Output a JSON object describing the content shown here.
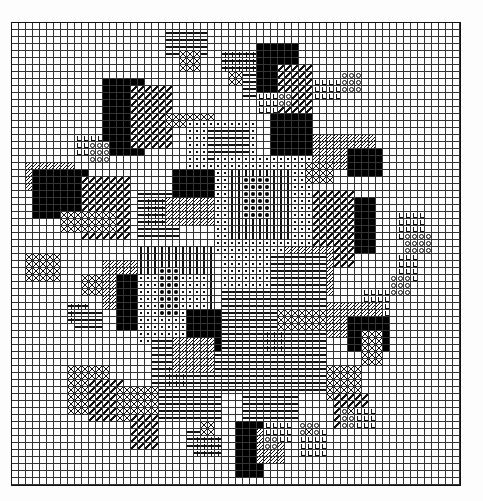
{
  "title": "Cross-stitch floral pattern chart",
  "grid": {
    "cols": 64,
    "rows": 66,
    "cell_px": 7,
    "line_color": "#333333",
    "border_color": "#111111"
  },
  "legend_symbols": {
    ".": "empty",
    "X": "cross stitch",
    "#": "dark filled cross",
    "/": "half diagonal stitch",
    "H": "hatched fill",
    "-": "dash",
    "|": "vertical bar",
    "o": "dot in square",
    "*": "filled dot",
    "+": "plus",
    "L": "L-shape",
    "O": "circle"
  },
  "regions": [
    {
      "sym": "-",
      "c0": 22,
      "c1": 27,
      "r0": 1,
      "r1": 4
    },
    {
      "sym": "X",
      "c0": 24,
      "c1": 26,
      "r0": 4,
      "r1": 6
    },
    {
      "sym": "+",
      "c0": 30,
      "c1": 34,
      "r0": 4,
      "r1": 6
    },
    {
      "sym": "-",
      "c0": 33,
      "c1": 35,
      "r0": 7,
      "r1": 10
    },
    {
      "sym": "X",
      "c0": 31,
      "c1": 32,
      "r0": 7,
      "r1": 8
    },
    {
      "sym": "#",
      "c0": 35,
      "c1": 40,
      "r0": 3,
      "r1": 10
    },
    {
      "sym": "/",
      "c0": 38,
      "c1": 42,
      "r0": 6,
      "r1": 14
    },
    {
      "sym": "#",
      "c0": 13,
      "c1": 18,
      "r0": 8,
      "r1": 18
    },
    {
      "sym": "/",
      "c0": 17,
      "c1": 22,
      "r0": 9,
      "r1": 17
    },
    {
      "sym": "X",
      "c0": 22,
      "c1": 28,
      "r0": 13,
      "r1": 14
    },
    {
      "sym": "o",
      "c0": 25,
      "c1": 34,
      "r0": 14,
      "r1": 20
    },
    {
      "sym": "-",
      "c0": 28,
      "c1": 33,
      "r0": 15,
      "r1": 19
    },
    {
      "sym": "#",
      "c0": 37,
      "c1": 42,
      "r0": 13,
      "r1": 18
    },
    {
      "sym": "H",
      "c0": 43,
      "c1": 51,
      "r0": 16,
      "r1": 20
    },
    {
      "sym": "#",
      "c0": 48,
      "c1": 52,
      "r0": 18,
      "r1": 21
    },
    {
      "sym": "L",
      "c0": 35,
      "c1": 37,
      "r0": 10,
      "r1": 12
    },
    {
      "sym": "O",
      "c0": 38,
      "c1": 39,
      "r0": 10,
      "r1": 11
    },
    {
      "sym": "L",
      "c0": 43,
      "c1": 46,
      "r0": 8,
      "r1": 10
    },
    {
      "sym": "O",
      "c0": 47,
      "c1": 49,
      "r0": 7,
      "r1": 9
    },
    {
      "sym": "L",
      "c0": 9,
      "c1": 12,
      "r0": 16,
      "r1": 18
    },
    {
      "sym": "O",
      "c0": 11,
      "c1": 13,
      "r0": 17,
      "r1": 19
    },
    {
      "sym": "H",
      "c0": 2,
      "c1": 8,
      "r0": 20,
      "r1": 23
    },
    {
      "sym": "#",
      "c0": 3,
      "c1": 10,
      "r0": 21,
      "r1": 27
    },
    {
      "sym": "/",
      "c0": 10,
      "c1": 16,
      "r0": 22,
      "r1": 30
    },
    {
      "sym": "X",
      "c0": 7,
      "c1": 14,
      "r0": 27,
      "r1": 29
    },
    {
      "sym": "-",
      "c0": 18,
      "c1": 23,
      "r0": 24,
      "r1": 30
    },
    {
      "sym": "+",
      "c0": 19,
      "c1": 21,
      "r0": 25,
      "r1": 28
    },
    {
      "sym": "#",
      "c0": 23,
      "c1": 28,
      "r0": 21,
      "r1": 25
    },
    {
      "sym": "H",
      "c0": 22,
      "c1": 28,
      "r0": 25,
      "r1": 28
    },
    {
      "sym": "o",
      "c0": 29,
      "c1": 42,
      "r0": 19,
      "r1": 32
    },
    {
      "sym": "|",
      "c0": 31,
      "c1": 39,
      "r0": 21,
      "r1": 30
    },
    {
      "sym": "*",
      "c0": 33,
      "c1": 36,
      "r0": 22,
      "r1": 27
    },
    {
      "sym": "#",
      "c0": 45,
      "c1": 51,
      "r0": 25,
      "r1": 32
    },
    {
      "sym": "/",
      "c0": 43,
      "c1": 48,
      "r0": 24,
      "r1": 34
    },
    {
      "sym": "X",
      "c0": 42,
      "c1": 45,
      "r0": 20,
      "r1": 22
    },
    {
      "sym": "L",
      "c0": 55,
      "c1": 58,
      "r0": 27,
      "r1": 30
    },
    {
      "sym": "O",
      "c0": 56,
      "c1": 59,
      "r0": 30,
      "r1": 32
    },
    {
      "sym": "L",
      "c0": 55,
      "c1": 57,
      "r0": 33,
      "r1": 36
    },
    {
      "sym": "O",
      "c0": 54,
      "c1": 56,
      "r0": 36,
      "r1": 38
    },
    {
      "sym": "L",
      "c0": 50,
      "c1": 53,
      "r0": 38,
      "r1": 41
    },
    {
      "sym": "H",
      "c0": 45,
      "c1": 52,
      "r0": 40,
      "r1": 44
    },
    {
      "sym": "#",
      "c0": 48,
      "c1": 53,
      "r0": 42,
      "r1": 46
    },
    {
      "sym": "H",
      "c0": 39,
      "c1": 45,
      "r0": 32,
      "r1": 38
    },
    {
      "sym": "#",
      "c0": 40,
      "c1": 44,
      "r0": 34,
      "r1": 38
    },
    {
      "sym": "X",
      "c0": 2,
      "c1": 6,
      "r0": 33,
      "r1": 36
    },
    {
      "sym": "X",
      "c0": 10,
      "c1": 16,
      "r0": 36,
      "r1": 38
    },
    {
      "sym": "+",
      "c0": 8,
      "c1": 10,
      "r0": 40,
      "r1": 42
    },
    {
      "sym": "-",
      "c0": 9,
      "c1": 12,
      "r0": 41,
      "r1": 43
    },
    {
      "sym": "H",
      "c0": 13,
      "c1": 17,
      "r0": 34,
      "r1": 40
    },
    {
      "sym": "#",
      "c0": 15,
      "c1": 20,
      "r0": 36,
      "r1": 43
    },
    {
      "sym": "|",
      "c0": 18,
      "c1": 28,
      "r0": 32,
      "r1": 45
    },
    {
      "sym": "o",
      "c0": 18,
      "c1": 27,
      "r0": 36,
      "r1": 45
    },
    {
      "sym": "*",
      "c0": 21,
      "c1": 23,
      "r0": 35,
      "r1": 41
    },
    {
      "sym": "-",
      "c0": 20,
      "c1": 29,
      "r0": 45,
      "r1": 56
    },
    {
      "sym": "+",
      "c0": 22,
      "c1": 24,
      "r0": 49,
      "r1": 51
    },
    {
      "sym": "#",
      "c0": 25,
      "c1": 29,
      "r0": 41,
      "r1": 46
    },
    {
      "sym": "H",
      "c0": 23,
      "c1": 28,
      "r0": 45,
      "r1": 49
    },
    {
      "sym": "-",
      "c0": 30,
      "c1": 44,
      "r0": 33,
      "r1": 52
    },
    {
      "sym": "o",
      "c0": 30,
      "c1": 36,
      "r0": 33,
      "r1": 37
    },
    {
      "sym": "+",
      "c0": 36,
      "c1": 38,
      "r0": 44,
      "r1": 46
    },
    {
      "sym": "X",
      "c0": 38,
      "c1": 44,
      "r0": 41,
      "r1": 43
    },
    {
      "sym": "X",
      "c0": 8,
      "c1": 13,
      "r0": 49,
      "r1": 55
    },
    {
      "sym": "/",
      "c0": 11,
      "c1": 15,
      "r0": 51,
      "r1": 56
    },
    {
      "sym": "X",
      "c0": 15,
      "c1": 20,
      "r0": 52,
      "r1": 56
    },
    {
      "sym": "/",
      "c0": 17,
      "c1": 20,
      "r0": 56,
      "r1": 60
    },
    {
      "sym": "X",
      "c0": 45,
      "c1": 49,
      "r0": 49,
      "r1": 53
    },
    {
      "sym": "X",
      "c0": 50,
      "c1": 52,
      "r0": 44,
      "r1": 48
    },
    {
      "sym": "/",
      "c0": 46,
      "c1": 50,
      "r0": 53,
      "r1": 57
    },
    {
      "sym": "-",
      "c0": 33,
      "c1": 40,
      "r0": 52,
      "r1": 56
    },
    {
      "sym": "#",
      "c0": 32,
      "c1": 35,
      "r0": 57,
      "r1": 64
    },
    {
      "sym": "H",
      "c0": 35,
      "c1": 38,
      "r0": 58,
      "r1": 62
    },
    {
      "sym": "L",
      "c0": 36,
      "c1": 39,
      "r0": 57,
      "r1": 59
    },
    {
      "sym": "O",
      "c0": 36,
      "c1": 37,
      "r0": 59,
      "r1": 60
    },
    {
      "sym": "L",
      "c0": 41,
      "c1": 44,
      "r0": 58,
      "r1": 61
    },
    {
      "sym": "O",
      "c0": 41,
      "c1": 43,
      "r0": 57,
      "r1": 58
    },
    {
      "sym": "X",
      "c0": 42,
      "c1": 42,
      "r0": 58,
      "r1": 58
    },
    {
      "sym": "L",
      "c0": 49,
      "c1": 51,
      "r0": 55,
      "r1": 57
    },
    {
      "sym": "O",
      "c0": 47,
      "c1": 48,
      "r0": 55,
      "r1": 57
    },
    {
      "sym": "X",
      "c0": 48,
      "c1": 48,
      "r0": 55,
      "r1": 55
    },
    {
      "sym": "-",
      "c0": 25,
      "c1": 27,
      "r0": 58,
      "r1": 60
    },
    {
      "sym": "+",
      "c0": 26,
      "c1": 29,
      "r0": 59,
      "r1": 61
    },
    {
      "sym": "X",
      "c0": 27,
      "c1": 28,
      "r0": 57,
      "r1": 58
    }
  ]
}
